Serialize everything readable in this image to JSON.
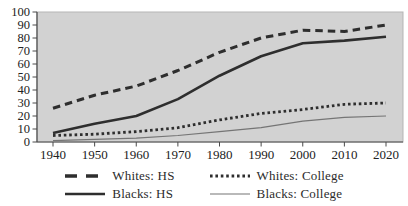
{
  "chart_data": {
    "type": "line",
    "title": "",
    "xlabel": "",
    "ylabel": "",
    "x": [
      1940,
      1950,
      1960,
      1970,
      1980,
      1990,
      2000,
      2010,
      2020
    ],
    "x_tick_labels": [
      "1940",
      "1950",
      "1960",
      "1970",
      "1980",
      "1990",
      "2000",
      "2010",
      "2020"
    ],
    "ylim": [
      0,
      100
    ],
    "y_ticks": [
      0,
      10,
      20,
      30,
      40,
      50,
      60,
      70,
      80,
      90,
      100
    ],
    "grid": false,
    "legend_position": "bottom",
    "plot_background": "#d2d2d2",
    "plot_border_color": "#b5b5b5",
    "axis_color": "#4a4a4a",
    "tick_label_color": "#222222",
    "series": [
      {
        "name": "Whites: HS",
        "style": "dashed",
        "color": "#2e2e2e",
        "values": [
          26,
          36,
          43,
          55,
          69,
          80,
          86,
          85,
          90
        ]
      },
      {
        "name": "Blacks: HS",
        "style": "solid",
        "color": "#2e2e2e",
        "values": [
          7,
          14,
          20,
          33,
          51,
          66,
          76,
          78,
          81
        ]
      },
      {
        "name": "Whites: College",
        "style": "dotted",
        "color": "#2e2e2e",
        "values": [
          5,
          6,
          8,
          11,
          17,
          22,
          25,
          29,
          30
        ]
      },
      {
        "name": "Blacks: College",
        "style": "thin",
        "color": "#757575",
        "values": [
          1,
          2,
          3,
          5,
          8,
          11,
          16,
          19,
          20
        ]
      }
    ],
    "legend_order": [
      0,
      2,
      1,
      3
    ]
  }
}
